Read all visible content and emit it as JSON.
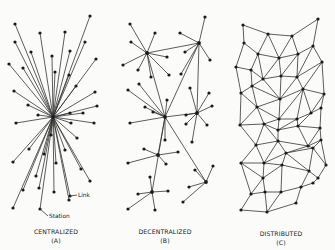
{
  "figure": {
    "panels": [
      {
        "id": "centralized",
        "title": "CENTRALIZED",
        "letter": "(A)",
        "hub": [
          53,
          117
        ],
        "spokes": [
          [
            15,
            24
          ],
          [
            40,
            33
          ],
          [
            65,
            32
          ],
          [
            90,
            16
          ],
          [
            15,
            42
          ],
          [
            31,
            52
          ],
          [
            70,
            51
          ],
          [
            85,
            42
          ],
          [
            9,
            64
          ],
          [
            23,
            68
          ],
          [
            52,
            56
          ],
          [
            55,
            72
          ],
          [
            69,
            75
          ],
          [
            96,
            59
          ],
          [
            76,
            86
          ],
          [
            14,
            91
          ],
          [
            28,
            105
          ],
          [
            95,
            92
          ],
          [
            97,
            106
          ],
          [
            38,
            115
          ],
          [
            16,
            123
          ],
          [
            70,
            113
          ],
          [
            83,
            113
          ],
          [
            71,
            123
          ],
          [
            94,
            123
          ],
          [
            51,
            135
          ],
          [
            77,
            138
          ],
          [
            29,
            149
          ],
          [
            13,
            162
          ],
          [
            44,
            154
          ],
          [
            56,
            163
          ],
          [
            65,
            150
          ],
          [
            81,
            169
          ],
          [
            36,
            176
          ],
          [
            90,
            181
          ],
          [
            23,
            190
          ],
          [
            39,
            188
          ],
          [
            54,
            192
          ],
          [
            69,
            200
          ],
          [
            13,
            208
          ],
          [
            40,
            209
          ],
          [
            70,
            196
          ]
        ],
        "annotations": [
          {
            "text": "Link",
            "x": 78,
            "y": 197,
            "pointer": [
              70,
              196
            ]
          },
          {
            "text": "Station",
            "x": 49,
            "y": 218,
            "pointer": [
              40,
              209
            ]
          }
        ]
      },
      {
        "id": "decentralized",
        "title": "DECENTRALIZED",
        "letter": "(B)",
        "hubs": {
          "A": [
            147,
            53
          ],
          "B": [
            199,
            43
          ],
          "C": [
            165,
            117
          ],
          "D": [
            197,
            113
          ],
          "E": [
            158,
            155
          ],
          "F": [
            206,
            182
          ],
          "G": [
            152,
            192
          ]
        },
        "leaves": [
          [
            "A",
            [
              130,
              24
            ]
          ],
          [
            "A",
            [
              155,
              33
            ]
          ],
          [
            "A",
            [
              131,
              42
            ]
          ],
          [
            "A",
            [
              123,
              65
            ]
          ],
          [
            "A",
            [
              138,
              70
            ]
          ],
          [
            "A",
            [
              167,
              57
            ]
          ],
          [
            "A",
            [
              169,
              75
            ]
          ],
          [
            "A",
            [
              151,
              77
            ]
          ],
          [
            "B",
            [
              205,
              17
            ]
          ],
          [
            "B",
            [
              180,
              33
            ]
          ],
          [
            "B",
            [
              185,
              52
            ]
          ],
          [
            "B",
            [
              210,
              60
            ]
          ],
          [
            "B",
            [
              181,
              74
            ]
          ],
          [
            "C",
            [
              128,
              90
            ]
          ],
          [
            "C",
            [
              139,
              84
            ]
          ],
          [
            "C",
            [
              145,
              107
            ]
          ],
          [
            "C",
            [
              153,
              112
            ]
          ],
          [
            "C",
            [
              167,
              100
            ]
          ],
          [
            "C",
            [
              130,
              123
            ]
          ],
          [
            "C",
            [
              165,
              140
            ]
          ],
          [
            "D",
            [
              190,
              88
            ]
          ],
          [
            "D",
            [
              209,
              93
            ]
          ],
          [
            "D",
            [
              212,
              106
            ]
          ],
          [
            "D",
            [
              186,
              115
            ]
          ],
          [
            "D",
            [
              186,
              124
            ]
          ],
          [
            "D",
            [
              207,
              125
            ]
          ],
          [
            "D",
            [
              192,
              142
            ]
          ],
          [
            "E",
            [
              144,
              149
            ]
          ],
          [
            "E",
            [
              128,
              163
            ]
          ],
          [
            "E",
            [
              178,
              152
            ]
          ],
          [
            "E",
            [
              166,
              164
            ]
          ],
          [
            "F",
            [
              195,
              170
            ]
          ],
          [
            "F",
            [
              213,
              166
            ]
          ],
          [
            "F",
            [
              189,
              187
            ]
          ],
          [
            "F",
            [
              183,
              202
            ]
          ],
          [
            "G",
            [
              150,
              177
            ]
          ],
          [
            "G",
            [
              138,
              194
            ]
          ],
          [
            "G",
            [
              168,
              191
            ]
          ],
          [
            "G",
            [
              128,
              209
            ]
          ],
          [
            "G",
            [
              155,
              210
            ]
          ]
        ],
        "hub_links": [
          [
            "A",
            "B"
          ],
          [
            "A",
            "C"
          ],
          [
            "B",
            "C"
          ],
          [
            "C",
            "D"
          ],
          [
            "C",
            "E"
          ],
          [
            "C",
            "G"
          ],
          [
            "C",
            "F"
          ],
          [
            "D",
            "B"
          ]
        ]
      },
      {
        "id": "distributed",
        "title": "DISTRIBUTED",
        "letter": "(C)",
        "nodes": [
          [
            243,
            25
          ],
          [
            268,
            34
          ],
          [
            292,
            36
          ],
          [
            318,
            19
          ],
          [
            244,
            43
          ],
          [
            258,
            54
          ],
          [
            279,
            58
          ],
          [
            298,
            54
          ],
          [
            313,
            46
          ],
          [
            236,
            67
          ],
          [
            251,
            70
          ],
          [
            263,
            79
          ],
          [
            281,
            76
          ],
          [
            297,
            77
          ],
          [
            322,
            62
          ],
          [
            241,
            93
          ],
          [
            252,
            86
          ],
          [
            280,
            99
          ],
          [
            303,
            89
          ],
          [
            324,
            94
          ],
          [
            257,
            107
          ],
          [
            279,
            119
          ],
          [
            297,
            119
          ],
          [
            311,
            113
          ],
          [
            321,
            108
          ],
          [
            240,
            125
          ],
          [
            264,
            124
          ],
          [
            278,
            130
          ],
          [
            298,
            126
          ],
          [
            320,
            128
          ],
          [
            256,
            145
          ],
          [
            278,
            141
          ],
          [
            308,
            146
          ],
          [
            321,
            140
          ],
          [
            241,
            163
          ],
          [
            264,
            163
          ],
          [
            286,
            153
          ],
          [
            313,
            148
          ],
          [
            326,
            165
          ],
          [
            263,
            178
          ],
          [
            282,
            165
          ],
          [
            309,
            171
          ],
          [
            318,
            178
          ],
          [
            251,
            194
          ],
          [
            265,
            192
          ],
          [
            281,
            192
          ],
          [
            301,
            187
          ],
          [
            313,
            183
          ],
          [
            241,
            210
          ],
          [
            267,
            212
          ],
          [
            296,
            203
          ]
        ],
        "edges": [
          [
            0,
            1
          ],
          [
            1,
            2
          ],
          [
            2,
            3
          ],
          [
            0,
            4
          ],
          [
            1,
            5
          ],
          [
            1,
            6
          ],
          [
            2,
            6
          ],
          [
            2,
            7
          ],
          [
            3,
            8
          ],
          [
            4,
            5
          ],
          [
            5,
            6
          ],
          [
            6,
            7
          ],
          [
            7,
            8
          ],
          [
            4,
            9
          ],
          [
            5,
            10
          ],
          [
            5,
            11
          ],
          [
            6,
            11
          ],
          [
            6,
            12
          ],
          [
            7,
            12
          ],
          [
            7,
            13
          ],
          [
            8,
            13
          ],
          [
            8,
            14
          ],
          [
            9,
            10
          ],
          [
            10,
            11
          ],
          [
            11,
            12
          ],
          [
            12,
            13
          ],
          [
            13,
            14
          ],
          [
            9,
            15
          ],
          [
            10,
            16
          ],
          [
            11,
            16
          ],
          [
            11,
            17
          ],
          [
            12,
            17
          ],
          [
            13,
            17
          ],
          [
            13,
            18
          ],
          [
            14,
            18
          ],
          [
            14,
            19
          ],
          [
            15,
            16
          ],
          [
            16,
            17
          ],
          [
            17,
            18
          ],
          [
            18,
            19
          ],
          [
            15,
            20
          ],
          [
            16,
            20
          ],
          [
            17,
            20
          ],
          [
            17,
            21
          ],
          [
            18,
            21
          ],
          [
            18,
            22
          ],
          [
            18,
            23
          ],
          [
            19,
            23
          ],
          [
            19,
            24
          ],
          [
            20,
            21
          ],
          [
            21,
            22
          ],
          [
            22,
            23
          ],
          [
            23,
            24
          ],
          [
            15,
            25
          ],
          [
            20,
            25
          ],
          [
            20,
            26
          ],
          [
            21,
            26
          ],
          [
            21,
            27
          ],
          [
            22,
            27
          ],
          [
            22,
            28
          ],
          [
            23,
            28
          ],
          [
            24,
            29
          ],
          [
            25,
            26
          ],
          [
            26,
            27
          ],
          [
            27,
            28
          ],
          [
            28,
            29
          ],
          [
            25,
            30
          ],
          [
            26,
            30
          ],
          [
            26,
            31
          ],
          [
            27,
            31
          ],
          [
            28,
            32
          ],
          [
            29,
            32
          ],
          [
            29,
            33
          ],
          [
            30,
            31
          ],
          [
            31,
            32
          ],
          [
            32,
            33
          ],
          [
            30,
            34
          ],
          [
            30,
            35
          ],
          [
            31,
            35
          ],
          [
            31,
            36
          ],
          [
            32,
            36
          ],
          [
            32,
            37
          ],
          [
            33,
            37
          ],
          [
            33,
            38
          ],
          [
            34,
            35
          ],
          [
            35,
            36
          ],
          [
            36,
            37
          ],
          [
            37,
            38
          ],
          [
            34,
            39
          ],
          [
            35,
            39
          ],
          [
            35,
            40
          ],
          [
            36,
            40
          ],
          [
            36,
            41
          ],
          [
            37,
            41
          ],
          [
            38,
            42
          ],
          [
            39,
            40
          ],
          [
            40,
            41
          ],
          [
            41,
            42
          ],
          [
            34,
            43
          ],
          [
            39,
            43
          ],
          [
            39,
            44
          ],
          [
            40,
            45
          ],
          [
            41,
            46
          ],
          [
            42,
            47
          ],
          [
            43,
            44
          ],
          [
            44,
            45
          ],
          [
            45,
            46
          ],
          [
            46,
            47
          ],
          [
            43,
            48
          ],
          [
            44,
            49
          ],
          [
            45,
            49
          ],
          [
            46,
            50
          ],
          [
            48,
            49
          ],
          [
            49,
            50
          ]
        ]
      }
    ]
  }
}
